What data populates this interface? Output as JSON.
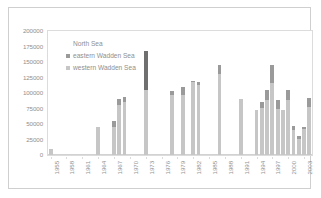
{
  "chart_data": {
    "type": "bar",
    "subtype": "stacked",
    "title": "",
    "xlabel": "",
    "ylabel": "",
    "ylim": [
      0,
      200000
    ],
    "ytick_step": 25000,
    "ytick_labels": [
      "200000",
      "175000",
      "150000",
      "125000",
      "100000",
      "75000",
      "50000",
      "25000",
      "0"
    ],
    "ytick_values": [
      200000,
      175000,
      150000,
      125000,
      100000,
      75000,
      50000,
      25000,
      0
    ],
    "grid": false,
    "legend_position": "inside-top-left",
    "xtick_labels": [
      "1955",
      "1958",
      "1961",
      "1964",
      "1967",
      "1970",
      "1973",
      "1976",
      "1979",
      "1982",
      "1985",
      "1988",
      "1991",
      "1994",
      "1997",
      "2000",
      "2003"
    ],
    "xtick_values": [
      1955,
      1958,
      1961,
      1964,
      1967,
      1970,
      1973,
      1976,
      1979,
      1982,
      1985,
      1988,
      1991,
      1994,
      1997,
      2000,
      2003
    ],
    "x_range": [
      1955,
      2004
    ],
    "series": [
      {
        "name": "western Wadden Sea",
        "color": "#c6c6c6"
      },
      {
        "name": "eastern Wadden Sea",
        "color": "#9a9a9a"
      },
      {
        "name": "North Sea",
        "color": "#6f6f6f"
      }
    ],
    "bars": [
      {
        "x": 1955,
        "western": 9000,
        "eastern": 0,
        "north": 0,
        "total": 9000
      },
      {
        "x": 1964,
        "western": 45000,
        "eastern": 0,
        "north": 0,
        "total": 45000
      },
      {
        "x": 1967,
        "western": 45000,
        "eastern": 10000,
        "north": 0,
        "total": 55000
      },
      {
        "x": 1968,
        "western": 80000,
        "eastern": 10000,
        "north": 0,
        "total": 90000
      },
      {
        "x": 1969,
        "western": 86000,
        "eastern": 8000,
        "north": 0,
        "total": 94000
      },
      {
        "x": 1973,
        "western": 105000,
        "eastern": 0,
        "north": 63000,
        "total": 168000
      },
      {
        "x": 1978,
        "western": 97000,
        "eastern": 6000,
        "north": 0,
        "total": 103000
      },
      {
        "x": 1980,
        "western": 97000,
        "eastern": 13000,
        "north": 0,
        "total": 110000
      },
      {
        "x": 1982,
        "western": 117000,
        "eastern": 3000,
        "north": 0,
        "total": 120000
      },
      {
        "x": 1983,
        "western": 113000,
        "eastern": 5000,
        "north": 0,
        "total": 118000
      },
      {
        "x": 1987,
        "western": 131000,
        "eastern": 14000,
        "north": 0,
        "total": 145000
      },
      {
        "x": 1991,
        "western": 90000,
        "eastern": 0,
        "north": 0,
        "total": 90000
      },
      {
        "x": 1994,
        "western": 72000,
        "eastern": 0,
        "north": 0,
        "total": 72000
      },
      {
        "x": 1995,
        "western": 76000,
        "eastern": 9000,
        "north": 0,
        "total": 85000
      },
      {
        "x": 1996,
        "western": 88000,
        "eastern": 17000,
        "north": 0,
        "total": 105000
      },
      {
        "x": 1997,
        "western": 116000,
        "eastern": 29000,
        "north": 0,
        "total": 145000
      },
      {
        "x": 1998,
        "western": 74000,
        "eastern": 15000,
        "north": 0,
        "total": 89000
      },
      {
        "x": 1999,
        "western": 72000,
        "eastern": 0,
        "north": 0,
        "total": 72000
      },
      {
        "x": 2000,
        "western": 88000,
        "eastern": 17000,
        "north": 0,
        "total": 105000
      },
      {
        "x": 2001,
        "western": 40000,
        "eastern": 7000,
        "north": 0,
        "total": 47000
      },
      {
        "x": 2002,
        "western": 26000,
        "eastern": 4000,
        "north": 0,
        "total": 30000
      },
      {
        "x": 2003,
        "western": 42000,
        "eastern": 4000,
        "north": 0,
        "total": 46000
      },
      {
        "x": 2004,
        "western": 78000,
        "eastern": 14000,
        "north": 0,
        "total": 92000
      }
    ]
  },
  "legend": {
    "items": [
      {
        "label": "North Sea",
        "swatch": "blank"
      },
      {
        "label": "eastern Wadden Sea",
        "swatch": "east"
      },
      {
        "label": "western Wadden Sea",
        "swatch": "west"
      }
    ]
  }
}
